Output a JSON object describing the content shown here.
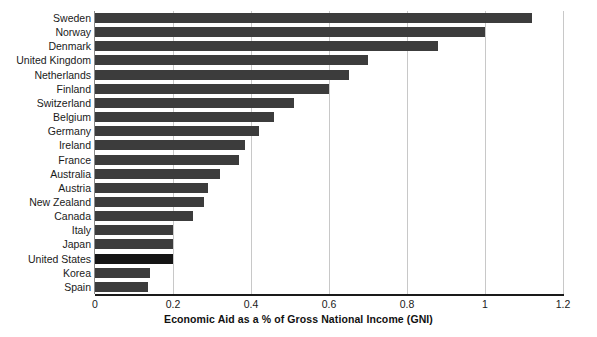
{
  "chart_data": {
    "type": "bar",
    "orientation": "horizontal",
    "title": "",
    "xlabel": "Economic Aid as a % of Gross National Income (GNI)",
    "ylabel": "",
    "xlim": [
      0,
      1.2
    ],
    "xticks": [
      "0",
      "0.2",
      "0.4",
      "0.6",
      "0.8",
      "1",
      "1.2"
    ],
    "xtick_values": [
      0,
      0.2,
      0.4,
      0.6,
      0.8,
      1,
      1.2
    ],
    "grid": "vertical",
    "legend": "none",
    "categories": [
      "Sweden",
      "Norway",
      "Denmark",
      "United Kingdom",
      "Netherlands",
      "Finland",
      "Switzerland",
      "Belgium",
      "Germany",
      "Ireland",
      "France",
      "Australia",
      "Austria",
      "New Zealand",
      "Canada",
      "Italy",
      "Japan",
      "United States",
      "Korea",
      "Spain"
    ],
    "values": [
      1.12,
      1.0,
      0.88,
      0.7,
      0.65,
      0.6,
      0.51,
      0.46,
      0.42,
      0.385,
      0.37,
      0.32,
      0.29,
      0.28,
      0.25,
      0.2,
      0.2,
      0.2,
      0.14,
      0.135
    ],
    "highlight_category": "United States",
    "bar_color": "#3c3c3c",
    "highlight_color": "#151515",
    "grid_color": "#c8c8c8",
    "axis_color": "#1a1a1a"
  }
}
